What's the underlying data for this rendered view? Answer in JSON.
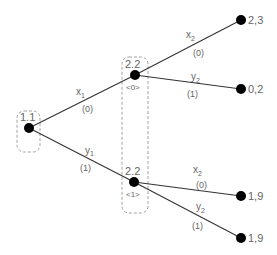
{
  "diagram": {
    "type": "game-tree",
    "nodes": {
      "root": {
        "label": "1.1",
        "x": 29,
        "y": 128
      },
      "n0": {
        "label": "2.2",
        "sub": "<0>",
        "x": 135,
        "y": 75
      },
      "n1": {
        "label": "2.2",
        "sub": "<1>",
        "x": 134,
        "y": 182
      },
      "l1": {
        "payoff": "2,3",
        "x": 241,
        "y": 20
      },
      "l2": {
        "payoff": "0,2",
        "x": 241,
        "y": 89
      },
      "l3": {
        "payoff": "1,9",
        "x": 241,
        "y": 196
      },
      "l4": {
        "payoff": "1,9",
        "x": 241,
        "y": 238
      }
    },
    "edges": {
      "root_n0": {
        "action": "x",
        "action_sub": "1",
        "prob": "(0)"
      },
      "root_n1": {
        "action": "y",
        "action_sub": "1",
        "prob": "(1)"
      },
      "n0_l1": {
        "action": "x",
        "action_sub": "2",
        "prob": "(0)"
      },
      "n0_l2": {
        "action": "y",
        "action_sub": "2",
        "prob": "(1)"
      },
      "n1_l3": {
        "action": "x",
        "action_sub": "2",
        "prob": "(0)"
      },
      "n1_l4": {
        "action": "y",
        "action_sub": "2",
        "prob": "(1)"
      }
    },
    "information_sets": [
      {
        "player": "1",
        "members": [
          "root"
        ]
      },
      {
        "player": "2",
        "members": [
          "n0",
          "n1"
        ]
      }
    ]
  }
}
